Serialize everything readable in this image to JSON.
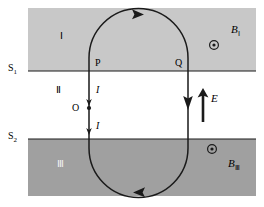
{
  "figure": {
    "canvas": {
      "width": 264,
      "height": 207
    },
    "colors": {
      "background": "#ffffff",
      "region_I_fill": "#c8c8c8",
      "region_III_fill": "#a0a0a0",
      "region_II_fill": "#ffffff",
      "stroke": "#1a1a1a",
      "white_label": "#f2f2f2"
    },
    "regions": [
      {
        "id": "I",
        "label": "Ⅰ",
        "fill": "#c8c8c8",
        "label_color": "#1a1a1a",
        "x": 28,
        "y": 8,
        "w": 228,
        "h": 63
      },
      {
        "id": "II",
        "label": "Ⅱ",
        "fill": "#ffffff",
        "label_color": "#1a1a1a",
        "x": 28,
        "y": 71,
        "w": 228,
        "h": 68
      },
      {
        "id": "III",
        "label": "Ⅲ",
        "fill": "#a0a0a0",
        "label_color": "#f2f2f2",
        "x": 28,
        "y": 139,
        "w": 228,
        "h": 57
      }
    ],
    "boundaries": [
      {
        "name": "S1",
        "label": "S",
        "subscript": "1",
        "y": 71
      },
      {
        "name": "S2",
        "label": "S",
        "subscript": "2",
        "y": 139
      }
    ],
    "field_labels": [
      {
        "name": "B_I",
        "label": "B",
        "subscript": "Ⅰ",
        "symbol": "out-of-page-dot",
        "x": 232,
        "y": 27,
        "dot_x": 214,
        "dot_y": 45
      },
      {
        "name": "B_III",
        "label": "B",
        "subscript": "Ⅲ",
        "symbol": "out-of-page-dot",
        "x": 229,
        "y": 162,
        "dot_x": 212,
        "dot_y": 149
      }
    ],
    "e_field": {
      "label": "E",
      "direction": "up",
      "x": 203,
      "y": 92,
      "length": 30,
      "label_x": 211,
      "label_y": 99
    },
    "loop": {
      "type": "stadium",
      "left_x": 89,
      "right_x": 188,
      "top_y": 14,
      "bottom_y": 192,
      "direction_labels": [
        {
          "name": "top-arrow",
          "direction": "right"
        },
        {
          "name": "right-arrow",
          "direction": "down"
        },
        {
          "name": "bottom-arrow",
          "direction": "left"
        }
      ]
    },
    "points": [
      {
        "name": "P",
        "label": "P",
        "x": 95,
        "y": 63
      },
      {
        "name": "Q",
        "label": "Q",
        "x": 175,
        "y": 63
      },
      {
        "name": "O",
        "label": "O",
        "x": 74,
        "y": 108,
        "dot_x": 89,
        "dot_y": 108
      }
    ],
    "currents": [
      {
        "name": "current-upper",
        "label": "I",
        "x": 96,
        "y": 89,
        "arrow_direction": "down"
      },
      {
        "name": "current-lower",
        "label": "I",
        "x": 96,
        "y": 125,
        "arrow_direction": "down"
      }
    ]
  }
}
